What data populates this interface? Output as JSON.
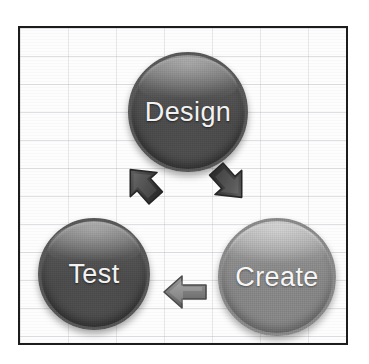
{
  "diagram": {
    "type": "cycle-diagram",
    "background": {
      "frame_border_color": "#1c1c1c",
      "canvas_color": "#fdfdfd",
      "grid": "graph-paper",
      "grid_line_color": "#969ba5"
    },
    "nodes": [
      {
        "id": "design",
        "label": "Design",
        "shape": "circle",
        "tone": "dark",
        "fill_color": "#545454",
        "text_color": "#f2f2f2",
        "position": "top-center"
      },
      {
        "id": "create",
        "label": "Create",
        "shape": "circle",
        "tone": "light",
        "fill_color": "#8e8e8e",
        "text_color": "#f6f6f6",
        "position": "bottom-right"
      },
      {
        "id": "test",
        "label": "Test",
        "shape": "circle",
        "tone": "dark",
        "fill_color": "#4f4f4f",
        "text_color": "#f2f2f2",
        "position": "bottom-left"
      }
    ],
    "arrows": [
      {
        "id": "test-to-design",
        "from": "test",
        "to": "design",
        "direction": "up-right",
        "color": "#3c3c3c"
      },
      {
        "id": "design-to-create",
        "from": "design",
        "to": "create",
        "direction": "down-right",
        "color": "#3c3c3c"
      },
      {
        "id": "create-to-test",
        "from": "create",
        "to": "test",
        "direction": "left",
        "color": "#707070"
      }
    ],
    "flow_order": [
      "Design",
      "Create",
      "Test"
    ]
  }
}
